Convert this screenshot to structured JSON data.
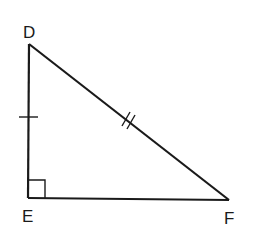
{
  "diagram": {
    "type": "right-triangle",
    "vertices": {
      "D": {
        "label": "D",
        "x": 29,
        "y": 44
      },
      "E": {
        "label": "E",
        "x": 28,
        "y": 198
      },
      "F": {
        "label": "F",
        "x": 229,
        "y": 200
      }
    },
    "marks": {
      "right_angle_at": "E",
      "single_tick_side": "DE",
      "double_tick_side": "DF"
    },
    "stroke_color": "#1a1a1a",
    "background": "#ffffff"
  }
}
